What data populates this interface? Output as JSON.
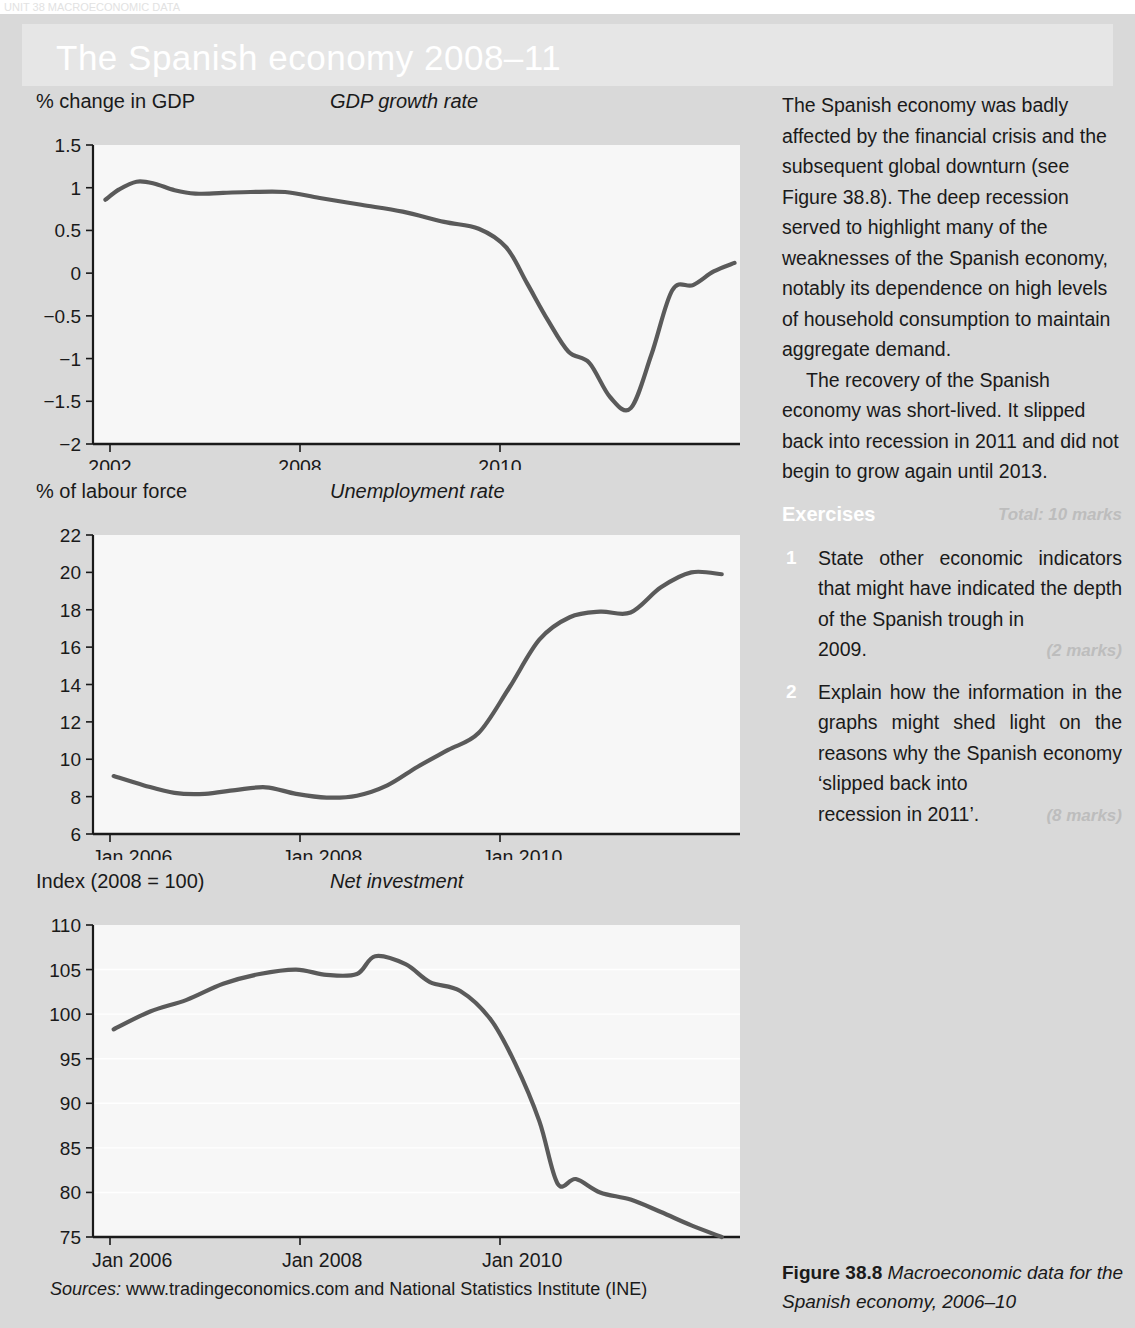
{
  "top_strip_text": "UNIT 38  MACROECONOMIC DATA",
  "banner": {
    "title": "The Spanish economy 2008–11"
  },
  "sources": {
    "label": "Sources:",
    "text": " www.tradingeconomics.com and National Statistics Institute (INE)"
  },
  "figure_caption": {
    "label": "Figure 38.8",
    "text": " Macroeconomic data for the Spanish economy, 2006–10"
  },
  "body": {
    "paragraph_1": "The Spanish economy was badly affected by the financial crisis and the subsequent global downturn (see Figure 38.8). The deep recession served to highlight many of the weaknesses of the Spanish economy, notably its dependence on high levels of household consumption to maintain aggregate demand.",
    "paragraph_2": "The recovery of the Spanish economy was short-lived. It slipped back into recession in 2011 and did not begin to grow again until 2013."
  },
  "exercises": {
    "heading": "Exercises",
    "total": "Total: 10 marks",
    "items": [
      {
        "number": "1",
        "text": "State other economic indicators that might have indicated the depth of the Spanish trough in",
        "last_line": "2009.",
        "marks": "(2 marks)"
      },
      {
        "number": "2",
        "text": "Explain how the information in the graphs might shed light on the reasons why the Spanish economy ‘slipped back into",
        "last_line": "recession in 2011’.",
        "marks": "(8 marks)"
      }
    ]
  },
  "chart_data": [
    {
      "id": "gdp-growth-rate",
      "type": "line",
      "title": "GDP growth rate",
      "ylabel": "% change in GDP",
      "xlabel": "",
      "ylim": [
        -2,
        1.5
      ],
      "yticks": [
        1.5,
        1,
        0.5,
        0,
        -0.5,
        -1,
        -1.5,
        -2
      ],
      "ytick_labels": [
        "1.5",
        "1",
        "0.5",
        "0",
        "−0.5",
        "−1",
        "−1.5",
        "−2"
      ],
      "xticks": [
        2002,
        2008,
        2010
      ],
      "xtick_labels": [
        "2002",
        "2008",
        "2010"
      ],
      "xlim": [
        2001.6,
        2011.1
      ],
      "grid": false,
      "line_color": "#5a5a5a",
      "x": [
        2001.9,
        2002.1,
        2002.35,
        2002.6,
        2002.9,
        2003.2,
        2003.6,
        2004.0,
        2004.5,
        2005.0,
        2005.6,
        2006.2,
        2006.8,
        2007.3,
        2007.7,
        2008.0,
        2008.3,
        2008.6,
        2008.9,
        2009.2,
        2009.5,
        2009.8,
        2010.1,
        2010.4,
        2010.7,
        2011.0
      ],
      "values": [
        0.86,
        0.98,
        1.07,
        1.05,
        0.97,
        0.93,
        0.94,
        0.95,
        0.95,
        0.88,
        0.8,
        0.72,
        0.6,
        0.52,
        0.3,
        -0.12,
        -0.55,
        -0.92,
        -1.05,
        -1.45,
        -1.58,
        -0.95,
        -0.2,
        -0.14,
        0.02,
        0.12
      ],
      "description": "Spanish quarterly GDP growth: ~0.9% in 2002, peak ~1.1%, gradual slide from 2006, sharp fall through 2008 to trough of about -1.6% in early 2009, recovery to about +0.2% by 2010-11 with a dip late 2010."
    },
    {
      "id": "unemployment-rate",
      "type": "line",
      "title": "Unemployment rate",
      "ylabel": "% of labour force",
      "xlabel": "",
      "ylim": [
        6,
        22
      ],
      "yticks": [
        22,
        20,
        18,
        16,
        14,
        12,
        10,
        8,
        6
      ],
      "ytick_labels": [
        "22",
        "20",
        "18",
        "16",
        "14",
        "12",
        "10",
        "8",
        "6"
      ],
      "xticks": [
        "Jan 2006",
        "Jan 2008",
        "Jan 2010"
      ],
      "xtick_labels": [
        "Jan 2006",
        "Jan 2008",
        "Jan 2010"
      ],
      "grid": false,
      "line_color": "#5a5a5a",
      "x": [
        2006.0,
        2006.25,
        2006.5,
        2006.75,
        2007.0,
        2007.25,
        2007.5,
        2007.75,
        2008.0,
        2008.25,
        2008.5,
        2008.75,
        2009.0,
        2009.25,
        2009.5,
        2009.75,
        2010.0,
        2010.25,
        2010.5,
        2010.75,
        2011.0
      ],
      "values": [
        9.1,
        8.6,
        8.2,
        8.15,
        8.35,
        8.5,
        8.15,
        7.95,
        8.05,
        8.6,
        9.6,
        10.5,
        11.4,
        13.8,
        16.4,
        17.6,
        17.9,
        17.85,
        19.2,
        20.0,
        19.9
      ],
      "description": "Spanish unemployment: about 9.1% in Jan 2006, falling to a low near 8% in late 2007, then rising steeply from 2008 to about 17.8% by late 2009, plateau, then rising to about 20.1% by 2011."
    },
    {
      "id": "net-investment",
      "type": "line",
      "title": "Net investment",
      "ylabel": "Index (2008 = 100)",
      "xlabel": "",
      "ylim": [
        75,
        110
      ],
      "yticks": [
        110,
        105,
        100,
        95,
        90,
        85,
        80,
        75
      ],
      "ytick_labels": [
        "110",
        "105",
        "100",
        "95",
        "90",
        "85",
        "80",
        "75"
      ],
      "xticks": [
        "Jan 2006",
        "Jan 2008",
        "Jan 2010"
      ],
      "xtick_labels": [
        "Jan 2006",
        "Jan 2008",
        "Jan 2010"
      ],
      "grid": true,
      "line_color": "#5a5a5a",
      "x": [
        2006.0,
        2006.3,
        2006.6,
        2006.9,
        2007.2,
        2007.5,
        2007.75,
        2008.0,
        2008.15,
        2008.4,
        2008.6,
        2008.85,
        2009.1,
        2009.3,
        2009.5,
        2009.65,
        2009.8,
        2010.0,
        2010.25,
        2010.5,
        2010.75,
        2011.0
      ],
      "values": [
        98.3,
        100.3,
        101.6,
        103.4,
        104.5,
        105.0,
        104.4,
        104.5,
        106.5,
        105.6,
        103.6,
        102.6,
        99.4,
        94.5,
        88.0,
        81.0,
        81.5,
        80.0,
        79.2,
        77.8,
        76.3,
        75.0
      ],
      "description": "Spanish net investment index (2008 = 100): rising from about 98 in Jan 2006 to a peak of about 106.5 in early 2008, then collapsing steeply through 2009 to about 81, with continued decline to about 75 by 2011."
    }
  ]
}
